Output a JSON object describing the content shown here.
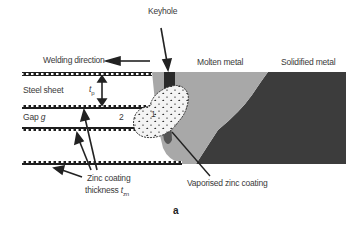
{
  "figure": {
    "panel_label": "a",
    "labels": {
      "keyhole": "Keyhole",
      "welding_direction": "Welding direction",
      "molten_metal": "Molten metal",
      "solidified_metal": "Solidified metal",
      "steel_sheet": "Steel sheet",
      "sheet_thickness_symbol": "t",
      "sheet_thickness_sub": "p",
      "gap": "Gap",
      "gap_symbol": "g",
      "zinc_coating_line1": "Zinc coating",
      "zinc_coating_line2": "thickness",
      "zinc_thickness_symbol": "t",
      "zinc_thickness_sub": "zn",
      "vaporised_zinc": "Vaporised zinc coating",
      "region_1": "1",
      "region_2": "2"
    },
    "colors": {
      "coating": "#1e1e1e",
      "molten_metal": "#a8a8a8",
      "solidified_metal": "#3c3c3c",
      "keyhole": "#2a2a2a",
      "vapour_bubble": "#f4f4f4",
      "text": "#3a3a3a"
    }
  }
}
